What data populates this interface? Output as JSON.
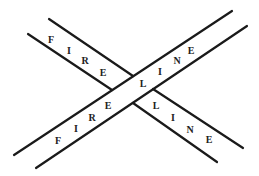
{
  "diagram": {
    "title": "",
    "colors": {
      "line": "#1a1a1a",
      "text": "#222222",
      "background": "#ffffff"
    },
    "bands": [
      {
        "name": "ascending-band",
        "edges": [
          {
            "x1": 14,
            "y1": 155,
            "x2": 232,
            "y2": 11
          },
          {
            "x1": 36,
            "y1": 168,
            "x2": 247,
            "y2": 26
          }
        ]
      },
      {
        "name": "descending-band",
        "edges": [
          {
            "x1": 49,
            "y1": 19,
            "x2": 133,
            "y2": 76
          },
          {
            "x1": 28,
            "y1": 34,
            "x2": 112,
            "y2": 90
          },
          {
            "x1": 153,
            "y1": 89,
            "x2": 243,
            "y2": 148
          },
          {
            "x1": 133,
            "y1": 103,
            "x2": 217,
            "y2": 162
          }
        ]
      }
    ],
    "labels": [
      {
        "group": "top-left-fire",
        "text": "F",
        "x": 51,
        "y": 40
      },
      {
        "group": "top-left-fire",
        "text": "I",
        "x": 69,
        "y": 51
      },
      {
        "group": "top-left-fire",
        "text": "R",
        "x": 85,
        "y": 61
      },
      {
        "group": "top-left-fire",
        "text": "E",
        "x": 103,
        "y": 73
      },
      {
        "group": "top-right-line",
        "text": "L",
        "x": 143,
        "y": 84
      },
      {
        "group": "top-right-line",
        "text": "I",
        "x": 160,
        "y": 72
      },
      {
        "group": "top-right-line",
        "text": "N",
        "x": 177,
        "y": 61
      },
      {
        "group": "top-right-line",
        "text": "E",
        "x": 191,
        "y": 51
      },
      {
        "group": "bottom-left-fire",
        "text": "F",
        "x": 58,
        "y": 141
      },
      {
        "group": "bottom-left-fire",
        "text": "I",
        "x": 76,
        "y": 129
      },
      {
        "group": "bottom-left-fire",
        "text": "R",
        "x": 92,
        "y": 118
      },
      {
        "group": "bottom-left-fire",
        "text": "E",
        "x": 108,
        "y": 106
      },
      {
        "group": "bottom-right-line",
        "text": "L",
        "x": 156,
        "y": 106
      },
      {
        "group": "bottom-right-line",
        "text": "I",
        "x": 173,
        "y": 118
      },
      {
        "group": "bottom-right-line",
        "text": "N",
        "x": 190,
        "y": 130
      },
      {
        "group": "bottom-right-line",
        "text": "E",
        "x": 209,
        "y": 140
      }
    ]
  }
}
